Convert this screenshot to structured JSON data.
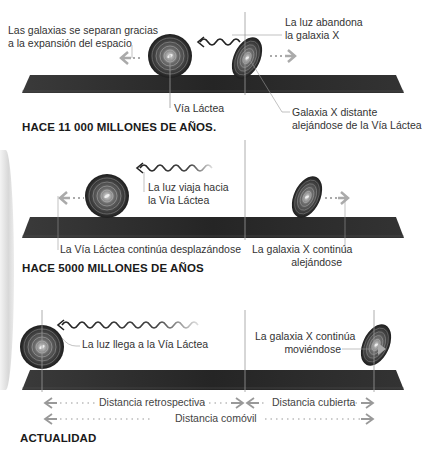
{
  "panels": [
    {
      "heading": "HACE 11 000 MILLONES DE AÑOS.",
      "labels": {
        "expansion_line1": "Las galaxias se separan gracias",
        "expansion_line2": "a la expansión del espacio",
        "light_leaves_line1": "La luz abandona",
        "light_leaves_line2": "la galaxia X",
        "milky_way": "Vía Láctea",
        "galaxy_x_line1": "Galaxia X distante",
        "galaxy_x_line2": "alejándose de la Vía Láctea"
      }
    },
    {
      "heading": "HACE 5000 MILLONES DE AÑOS",
      "labels": {
        "light_travels_line1": "La luz viaja hacia",
        "light_travels_line2": "la Vía Láctea",
        "milky_way_moves": "La Vía Láctea continúa desplazándose",
        "galaxy_x_line1": "La galaxia X continúa",
        "galaxy_x_line2": "alejándose"
      }
    },
    {
      "heading": "ACTUALIDAD",
      "labels": {
        "light_arrives": "La luz llega a la Vía Láctea",
        "galaxy_x_line1": "La galaxia X continúa",
        "galaxy_x_line2": "moviéndose"
      },
      "distances": {
        "lookback": "Distancia retrospectiva",
        "covered": "Distancia cubierta",
        "comoving": "Distancia comóvil"
      }
    }
  ],
  "colors": {
    "bar": "#2a2a2a",
    "galaxy": "#1e1e1e",
    "arrow_gray": "#a0a0a0",
    "text": "#333333"
  }
}
